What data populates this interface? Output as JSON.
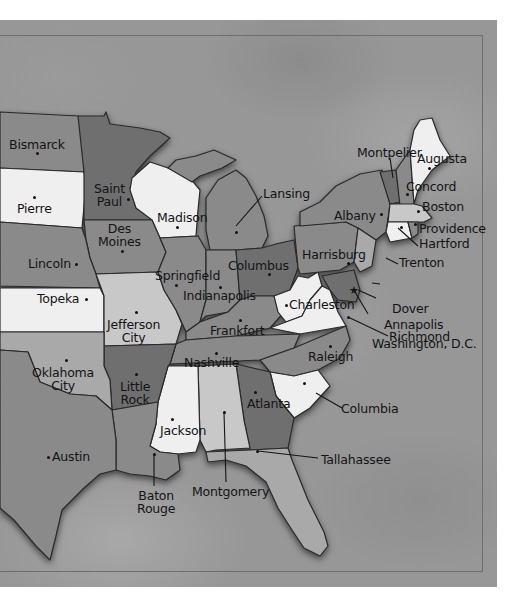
{
  "map": {
    "title": "",
    "region": "United States (central and eastern)",
    "colors": {
      "background": "#979797",
      "state_dark": "#6f6f6f",
      "state_mid": "#8a8a8a",
      "state_light": "#a9a9a9",
      "state_pale": "#c8c8c8",
      "state_white": "#efefef",
      "label_text": "#141414"
    },
    "capitals": [
      {
        "id": "bismarck",
        "label": "Bismarck"
      },
      {
        "id": "pierre",
        "label": "Pierre"
      },
      {
        "id": "saint-paul",
        "label": "Saint Paul",
        "line1": "Saint",
        "line2": "Paul"
      },
      {
        "id": "madison",
        "label": "Madison"
      },
      {
        "id": "lansing",
        "label": "Lansing"
      },
      {
        "id": "des-moines",
        "label": "Des Moines",
        "line1": "Des",
        "line2": "Moines"
      },
      {
        "id": "lincoln",
        "label": "Lincoln"
      },
      {
        "id": "topeka",
        "label": "Topeka"
      },
      {
        "id": "springfield",
        "label": "Springfield"
      },
      {
        "id": "indianapolis",
        "label": "Indianapolis"
      },
      {
        "id": "columbus",
        "label": "Columbus"
      },
      {
        "id": "jefferson-city",
        "label": "Jefferson City",
        "line1": "Jefferson",
        "line2": "City"
      },
      {
        "id": "frankfort",
        "label": "Frankfort"
      },
      {
        "id": "nashville",
        "label": "Nashville"
      },
      {
        "id": "oklahoma-city",
        "label": "Oklahoma City",
        "line1": "Oklahoma",
        "line2": "City"
      },
      {
        "id": "little-rock",
        "label": "Little Rock",
        "line1": "Little",
        "line2": "Rock"
      },
      {
        "id": "jackson",
        "label": "Jackson"
      },
      {
        "id": "atlanta",
        "label": "Atlanta"
      },
      {
        "id": "austin",
        "label": "Austin"
      },
      {
        "id": "baton-rouge",
        "label": "Baton Rouge",
        "line1": "Baton",
        "line2": "Rouge"
      },
      {
        "id": "montgomery",
        "label": "Montgomery"
      },
      {
        "id": "tallahassee",
        "label": "Tallahassee"
      },
      {
        "id": "columbia",
        "label": "Columbia"
      },
      {
        "id": "raleigh",
        "label": "Raleigh"
      },
      {
        "id": "richmond",
        "label": "Richmond"
      },
      {
        "id": "charleston",
        "label": "Charleston"
      },
      {
        "id": "washington-dc",
        "label": "Washington, D.C."
      },
      {
        "id": "annapolis",
        "label": "Annapolis"
      },
      {
        "id": "dover",
        "label": "Dover"
      },
      {
        "id": "trenton",
        "label": "Trenton"
      },
      {
        "id": "harrisburg",
        "label": "Harrisburg"
      },
      {
        "id": "albany",
        "label": "Albany"
      },
      {
        "id": "hartford",
        "label": "Hartford"
      },
      {
        "id": "providence",
        "label": "Providence"
      },
      {
        "id": "boston",
        "label": "Boston"
      },
      {
        "id": "concord",
        "label": "Concord"
      },
      {
        "id": "montpelier",
        "label": "Montpelier"
      },
      {
        "id": "augusta",
        "label": "Augusta"
      }
    ]
  }
}
